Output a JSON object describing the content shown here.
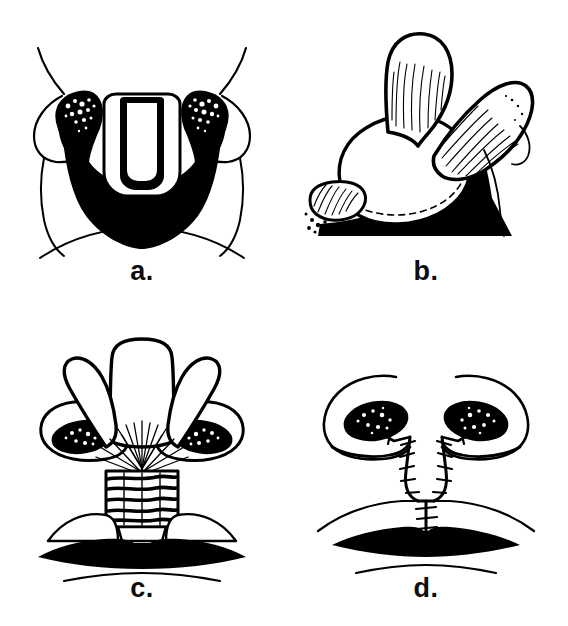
{
  "figure": {
    "type": "surgical-illustration",
    "background_color": "#ffffff",
    "ink_color": "#000000",
    "panel_count": 4,
    "layout": "2x2 grid"
  },
  "panels": [
    {
      "id": "a",
      "label": "a.",
      "position": "top-left",
      "view": "basal (worm's-eye) view of nose",
      "description": "Pre-operative basal view showing short columella, flared alar rims, stippled dark nostril vestibules and solid black upper lip shadow with planned flap outlines",
      "features": [
        "alar-rim-left",
        "alar-rim-right",
        "nostril-left",
        "nostril-right",
        "columella-flap-outline",
        "upper-lip-shadow"
      ]
    },
    {
      "id": "b",
      "label": "b.",
      "position": "top-right",
      "view": "oblique three-quarter view",
      "description": "Flaps elevated and rotated upward, shown with fine hatched shading; small hatched lip flap at lower left over solid black base",
      "features": [
        "elevated-flap-upper",
        "elevated-flap-lateral",
        "nasal-dome",
        "small-lip-flap",
        "black-base-shadow"
      ]
    },
    {
      "id": "c",
      "label": "c.",
      "position": "bottom-left",
      "view": "basal view, flaps splayed",
      "description": "Three flaps splayed open in a fan, radiating dissection lines converging centrally, striated cartilage columella strut graft in place, dark stippled nostrils and black vermilion lip",
      "features": [
        "central-flap",
        "lateral-flap-left",
        "lateral-flap-right",
        "radiating-dissection-lines",
        "columella-strut-graft",
        "nostril-left",
        "nostril-right",
        "vermilion-lip",
        "lower-lip-line"
      ]
    },
    {
      "id": "d",
      "label": "d.",
      "position": "bottom-right",
      "view": "basal view, closed",
      "description": "Post-operative result with lengthened columella; suture lines with cross stitches along the columella and lip, dark stippled nostrils, black vermilion lip and lower lip line",
      "features": [
        "alar-rim-left",
        "alar-rim-right",
        "nostril-left",
        "nostril-right",
        "suture-line-columella-left",
        "suture-line-columella-right",
        "suture-line-lip",
        "vermilion-lip",
        "lower-lip-line"
      ]
    }
  ]
}
